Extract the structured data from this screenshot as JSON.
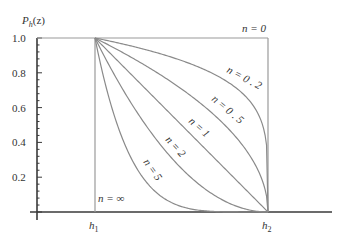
{
  "chart_data": {
    "type": "line",
    "title": "",
    "ylabel": "P_h(z)",
    "xlabel": "",
    "ylim": [
      0,
      1.0
    ],
    "yticks": [
      0.2,
      0.4,
      0.6,
      0.8,
      1.0
    ],
    "ytick_labels": [
      "0.2",
      "0.4",
      "0.6",
      "0.8",
      "1.0"
    ],
    "xtick_labels": [
      {
        "label": "h",
        "sub": "1",
        "t": 0
      },
      {
        "label": "h",
        "sub": "2",
        "t": 1
      }
    ],
    "formula": "P = (1 - t)^n, t = (z - h1)/(h2 - h1)",
    "grid": false,
    "series": [
      {
        "name": "n = 0",
        "n": 0,
        "label": "n = 0"
      },
      {
        "name": "n = 0.2",
        "n": 0.2,
        "label": "n = 0 . 2"
      },
      {
        "name": "n = 0.5",
        "n": 0.5,
        "label": "n = 0 . 5"
      },
      {
        "name": "n = 1",
        "n": 1,
        "label": "n = 1"
      },
      {
        "name": "n = 2",
        "n": 2,
        "label": "n = 2"
      },
      {
        "name": "n = 5",
        "n": 5,
        "label": "n = 5"
      },
      {
        "name": "n = ∞",
        "n": "infinity",
        "label": "n = ∞"
      }
    ]
  },
  "labels": {
    "ylabel_main": "P",
    "ylabel_sub": "h",
    "ylabel_arg": "(z)",
    "n0": "n = 0",
    "n02": "n = 0 . 2",
    "n05": "n = 0 . 5",
    "n1": "n = 1",
    "n2": "n = 2",
    "n5": "n = 5",
    "ninf": "n = ∞",
    "h": "h",
    "h1_sub": "1",
    "h2_sub": "2",
    "y02": "0.2",
    "y04": "0.4",
    "y06": "0.6",
    "y08": "0.8",
    "y10": "1.0"
  }
}
